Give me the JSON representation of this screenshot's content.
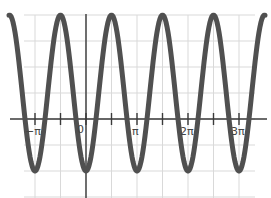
{
  "chart_data": {
    "type": "line",
    "title": "",
    "xlabel": "",
    "ylabel": "",
    "function": "y = 1 - 3cos(2x)",
    "series": [
      {
        "name": "y = 1 - 3cos(2x)",
        "color": "#505050",
        "x": [
          "-3.0",
          "-π",
          "-3π/4",
          "-π/2",
          "-π/4",
          "0",
          "π/4",
          "π/2",
          "3π/4",
          "π",
          "5π/4",
          "3π/2",
          "7π/4",
          "2π",
          "9π/4",
          "5π/2",
          "11π/4",
          "3π",
          "3.5π"
        ],
        "values": [
          -1.88,
          -2,
          1,
          4,
          1,
          -2,
          1,
          4,
          1,
          -2,
          1,
          4,
          1,
          -2,
          1,
          4,
          1,
          -2,
          4
        ]
      }
    ],
    "xlim": [
      "-1.48π",
      "3.53π"
    ],
    "ylim": [
      -3,
      4
    ],
    "x_tick_labels": [
      "-π",
      "0",
      "π",
      "2π",
      "3π"
    ],
    "x_minor_ticks": [
      "-π/2",
      "π/2",
      "3π/2",
      "5π/2"
    ],
    "grid": true,
    "legend": "none"
  },
  "labels": {
    "neg_pi": "−π",
    "zero": "0",
    "pi": "π",
    "two_pi": "2π",
    "three_pi": "3π"
  }
}
